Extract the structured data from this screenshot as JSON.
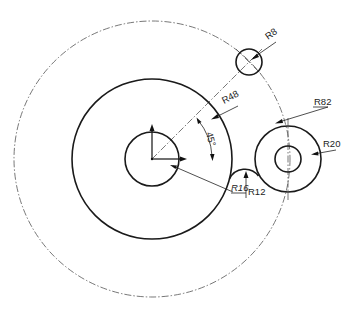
{
  "drawing": {
    "type": "mechanical-drawing",
    "circles": [
      {
        "id": "pitch-circle-r82",
        "cx": 152,
        "cy": 159,
        "r": 138,
        "style": "center-line"
      },
      {
        "id": "main-circle-r48",
        "cx": 152,
        "cy": 159,
        "r": 80,
        "style": "solid"
      },
      {
        "id": "hub-circle-r16",
        "cx": 152,
        "cy": 159,
        "r": 27,
        "style": "solid"
      },
      {
        "id": "small-circle-r8",
        "cx": 249,
        "cy": 62,
        "r": 13,
        "style": "solid"
      },
      {
        "id": "right-outer-circle-r20",
        "cx": 288,
        "cy": 159,
        "r": 33,
        "style": "solid"
      },
      {
        "id": "right-inner-circle",
        "cx": 288,
        "cy": 159,
        "r": 13,
        "style": "solid"
      }
    ],
    "fillet": {
      "id": "fillet-r12",
      "label": "R12"
    },
    "dimensions": {
      "r8": "R8",
      "r48": "R48",
      "r82": "R82",
      "r20": "R20",
      "r16": "R16",
      "r12": "R12",
      "angle": "45°"
    },
    "colors": {
      "line": "#1a1a1a",
      "center_line": "#555555",
      "background": "#ffffff"
    }
  }
}
